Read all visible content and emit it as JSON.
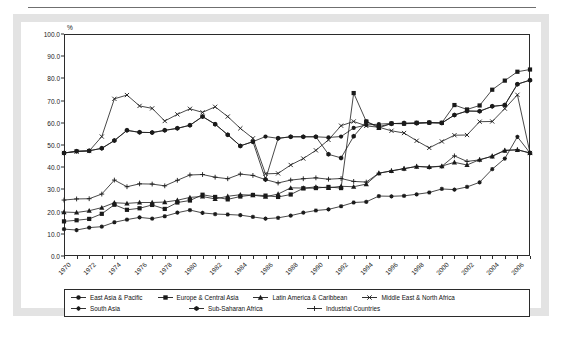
{
  "chart_data": {
    "type": "line",
    "title": "",
    "xlabel": "",
    "ylabel": "%",
    "ylim": [
      0.0,
      100.0
    ],
    "ytick_step": 10.0,
    "ytick_labels": [
      "0.0",
      "10.0",
      "20.0",
      "30.0",
      "40.0",
      "50.0",
      "60.0",
      "70.0",
      "80.0",
      "90.0",
      "100.0"
    ],
    "xlim": [
      1970,
      2007
    ],
    "x": [
      1970,
      1971,
      1972,
      1973,
      1974,
      1975,
      1976,
      1977,
      1978,
      1979,
      1980,
      1981,
      1982,
      1983,
      1984,
      1985,
      1986,
      1987,
      1988,
      1989,
      1990,
      1991,
      1992,
      1993,
      1994,
      1995,
      1996,
      1997,
      1998,
      1999,
      2000,
      2001,
      2002,
      2003,
      2004,
      2005,
      2006,
      2007
    ],
    "xtick_labels": [
      "1970",
      "1972",
      "1974",
      "1976",
      "1978",
      "1980",
      "1982",
      "1984",
      "1986",
      "1988",
      "1990",
      "1992",
      "1994",
      "1996",
      "1998",
      "2000",
      "2002",
      "2004",
      "2006"
    ],
    "xtick_label_years": [
      1970,
      1972,
      1974,
      1976,
      1978,
      1980,
      1982,
      1984,
      1986,
      1988,
      1990,
      1992,
      1994,
      1996,
      1998,
      2000,
      2002,
      2004,
      2006
    ],
    "grid": false,
    "legend_position": "bottom",
    "series": [
      {
        "name": "East Asia & Pacific",
        "marker": "circle",
        "values": [
          46.4,
          47.2,
          47.4,
          48.5,
          52.0,
          56.6,
          55.7,
          55.6,
          56.6,
          57.5,
          58.9,
          62.8,
          59.4,
          54.6,
          49.6,
          51.5,
          53.8,
          53.0,
          53.7,
          53.7,
          53.7,
          53.4,
          53.8,
          57.7,
          59.0,
          59.4,
          59.7,
          59.6,
          59.7,
          60.0,
          59.9,
          63.5,
          65.3,
          65.2,
          67.4,
          68.0,
          77.4,
          79.2
        ]
      },
      {
        "name": "Europe & Central Asia",
        "marker": "square",
        "values": [
          15.6,
          16.1,
          16.7,
          19.0,
          23.1,
          20.8,
          21.5,
          23.0,
          21.2,
          24.1,
          25.0,
          27.6,
          26.6,
          25.5,
          26.8,
          27.5,
          27.2,
          26.6,
          27.7,
          30.5,
          30.6,
          31.1,
          30.6,
          73.4,
          60.6,
          57.7,
          59.7,
          59.6,
          60.0,
          60.1,
          60.0,
          68.0,
          66.0,
          67.8,
          74.9,
          79.0,
          83.0,
          84.0
        ]
      },
      {
        "name": "Latin America & Caribbean",
        "marker": "triangle",
        "values": [
          19.8,
          19.6,
          20.4,
          21.8,
          24.0,
          23.7,
          24.1,
          24.1,
          24.3,
          25.1,
          26.4,
          26.8,
          25.7,
          26.9,
          27.6,
          27.4,
          26.7,
          27.9,
          30.7,
          30.6,
          31.1,
          30.7,
          31.4,
          31.2,
          32.4,
          37.3,
          38.3,
          39.4,
          40.3,
          40.1,
          40.5,
          42.2,
          41.0,
          43.4,
          44.9,
          47.5,
          47.8,
          46.4
        ]
      },
      {
        "name": "Middle East & North Africa",
        "marker": "x",
        "values": [
          46.4,
          47.0,
          47.3,
          53.8,
          70.8,
          72.5,
          67.6,
          66.5,
          60.8,
          63.8,
          66.3,
          64.7,
          67.2,
          62.8,
          57.5,
          53.0,
          37.0,
          37.2,
          41.0,
          43.9,
          47.6,
          52.3,
          58.7,
          60.6,
          58.6,
          58.0,
          56.4,
          55.4,
          51.9,
          48.7,
          51.6,
          54.4,
          54.5,
          60.5,
          60.6,
          66.4,
          72.6,
          46.4
        ]
      },
      {
        "name": "South Asia",
        "marker": "star",
        "values": [
          12.1,
          11.7,
          12.8,
          13.2,
          15.2,
          16.4,
          17.4,
          16.8,
          17.9,
          19.5,
          20.7,
          19.4,
          18.9,
          18.7,
          18.4,
          17.6,
          16.8,
          17.2,
          18.2,
          19.5,
          20.5,
          21.0,
          22.4,
          24.1,
          24.4,
          27.0,
          26.9,
          27.1,
          27.8,
          28.6,
          30.2,
          29.9,
          31.1,
          33.2,
          39.1,
          43.9,
          53.7,
          46.4
        ]
      },
      {
        "name": "Sub-Saharan Africa",
        "marker": "hexagon",
        "values": [
          46.4,
          47.2,
          47.4,
          48.5,
          52.0,
          56.6,
          55.7,
          55.6,
          56.6,
          57.5,
          58.9,
          62.8,
          59.4,
          54.6,
          49.6,
          51.5,
          34.5,
          53.0,
          53.7,
          53.7,
          53.7,
          45.8,
          44.2,
          53.9,
          60.5,
          58.3,
          59.6,
          59.9,
          59.9,
          60.1,
          59.9,
          63.5,
          65.3,
          65.2,
          67.4,
          68.0,
          77.4,
          79.2
        ]
      },
      {
        "name": "Industrial Countries",
        "marker": "plus",
        "values": [
          25.2,
          25.7,
          25.8,
          27.9,
          34.2,
          31.2,
          32.5,
          32.4,
          31.6,
          34.1,
          36.5,
          36.7,
          35.5,
          34.8,
          36.9,
          36.3,
          34.4,
          32.9,
          34.2,
          34.8,
          35.2,
          34.6,
          34.9,
          33.6,
          33.3,
          37.3,
          38.4,
          39.3,
          40.4,
          40.0,
          40.4,
          45.1,
          42.6,
          43.3,
          45.0,
          47.6,
          47.9,
          46.4
        ]
      }
    ]
  },
  "legend": {
    "items": [
      {
        "label": "East Asia & Pacific",
        "marker": "circle"
      },
      {
        "label": "Europe & Central Asia",
        "marker": "square"
      },
      {
        "label": "Latin America & Caribbean",
        "marker": "triangle"
      },
      {
        "label": "Middle East & North Africa",
        "marker": "x"
      },
      {
        "label": "South Asia",
        "marker": "star"
      },
      {
        "label": "Sub-Saharan Africa",
        "marker": "hexagon"
      },
      {
        "label": "Industrial Countries",
        "marker": "plus"
      }
    ],
    "rows": [
      [
        0,
        1,
        2,
        3
      ],
      [
        4,
        5,
        6
      ]
    ]
  },
  "style": {
    "line_color": "#1a1a1a",
    "axis_color": "#2b2b2b",
    "frame_color": "#e3e3e3",
    "panel_color": "#ffffff",
    "text_color": "#1a1a1a"
  }
}
